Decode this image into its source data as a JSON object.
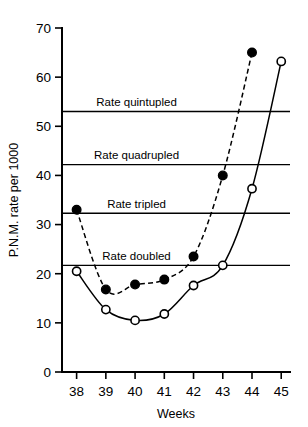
{
  "chart_data": {
    "type": "line",
    "title": "",
    "subtitle": "",
    "xlabel": "Weeks",
    "ylabel": "P.N.M. rate per 1000",
    "xlim": [
      37.5,
      45.3
    ],
    "ylim": [
      0,
      70
    ],
    "grid": false,
    "legend_position": "none",
    "x_ticks": [
      38,
      39,
      40,
      41,
      42,
      43,
      44,
      45
    ],
    "x_tick_labels": [
      "38",
      "39",
      "40",
      "41",
      "42",
      "43",
      "44",
      "45"
    ],
    "y_ticks": [
      0,
      10,
      20,
      30,
      40,
      50,
      60,
      70
    ],
    "y_tick_labels": [
      "0",
      "10",
      "20",
      "30",
      "40",
      "50",
      "60",
      "70"
    ],
    "series": [
      {
        "name": "open-circle-series",
        "marker": "open-circle",
        "line_style": "solid",
        "x": [
          38,
          39,
          40,
          41,
          42,
          43,
          44,
          45
        ],
        "values": [
          20.5,
          12.7,
          10.5,
          11.8,
          17.6,
          21.7,
          37.3,
          63.2
        ]
      },
      {
        "name": "filled-circle-series",
        "marker": "filled-circle",
        "line_style": "dashed",
        "x": [
          38,
          39,
          40,
          41,
          42,
          43,
          44
        ],
        "values": [
          33.0,
          16.8,
          17.8,
          18.8,
          23.5,
          40.0,
          65.0
        ]
      }
    ],
    "reference_lines": [
      {
        "label": "Rate doubled",
        "value": 21.7,
        "label_x": 40.05
      },
      {
        "label": "Rate tripled",
        "value": 32.3,
        "label_x": 40.05
      },
      {
        "label": "Rate quadrupled",
        "value": 42.2,
        "label_x": 40.05
      },
      {
        "label": "Rate quintupled",
        "value": 53.0,
        "label_x": 40.05
      }
    ],
    "annotations": [],
    "colors": {
      "axis": "#000000",
      "reference_line": "#000000",
      "series_line": "#000000",
      "background": "#ffffff"
    }
  }
}
